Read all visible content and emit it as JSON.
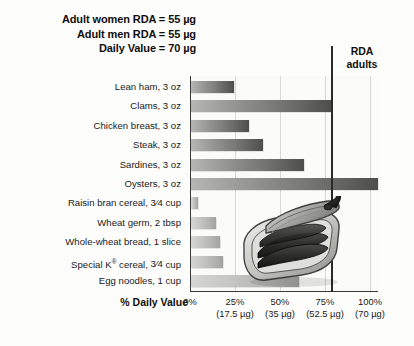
{
  "header": {
    "lines": [
      "Adult women RDA = 55 µg",
      "Adult men RDA = 55 µg",
      "Daily Value = 70 µg"
    ]
  },
  "rda_marker": {
    "line1": "RDA",
    "line2": "adults",
    "value_percent": 78.6,
    "color": "#2a2a28"
  },
  "axis_title": "% Daily Value",
  "illustration": {
    "name": "open-sardine-can",
    "description": "opened tin of sardines with rolled-back lid and key"
  },
  "chart_data": {
    "type": "bar",
    "orientation": "horizontal",
    "title": "",
    "xlabel": "% Daily Value",
    "ylabel": "",
    "xlim": [
      0,
      104
    ],
    "grid": true,
    "legend": "none",
    "categories": [
      "Lean ham, 3 oz",
      "Clams, 3 oz",
      "Chicken breast, 3 oz",
      "Steak, 3 oz",
      "Sardines, 3 oz",
      "Oysters, 3 oz",
      "Raisin bran cereal, 3/4 cup",
      "Wheat germ, 2 tbsp",
      "Whole-wheat bread, 1 slice",
      "Special K® cereal, 3/4 cup",
      "Egg noodles, 1 cup"
    ],
    "values": [
      24,
      78,
      32,
      40,
      63,
      104,
      4,
      14,
      16,
      18,
      60
    ],
    "shades": [
      "dark",
      "dark",
      "dark",
      "dark",
      "dark",
      "dark",
      "light",
      "light",
      "light",
      "light",
      "light"
    ],
    "ticks": [
      {
        "percent": "0%",
        "ug": ""
      },
      {
        "percent": "25%",
        "ug": "(17.5 µg)"
      },
      {
        "percent": "50%",
        "ug": "(35 µg)"
      },
      {
        "percent": "75%",
        "ug": "(52.5 µg)"
      },
      {
        "percent": "100%",
        "ug": "(70 µg)"
      }
    ],
    "tick_positions": [
      0,
      25,
      50,
      75,
      100
    ],
    "reference_line": {
      "label": "RDA adults",
      "value": 78.6
    }
  },
  "labels_rich": [
    {
      "pre": "Lean ham, 3 oz",
      "num": "",
      "den": "",
      "post": "",
      "reg": false
    },
    {
      "pre": "Clams, 3 oz",
      "num": "",
      "den": "",
      "post": "",
      "reg": false
    },
    {
      "pre": "Chicken breast, 3 oz",
      "num": "",
      "den": "",
      "post": "",
      "reg": false
    },
    {
      "pre": "Steak, 3 oz",
      "num": "",
      "den": "",
      "post": "",
      "reg": false
    },
    {
      "pre": "Sardines, 3 oz",
      "num": "",
      "den": "",
      "post": "",
      "reg": false
    },
    {
      "pre": "Oysters, 3 oz",
      "num": "",
      "den": "",
      "post": "",
      "reg": false
    },
    {
      "pre": "Raisin bran cereal, ",
      "num": "3",
      "den": "4",
      "post": " cup",
      "reg": false
    },
    {
      "pre": "Wheat germ, 2 tbsp",
      "num": "",
      "den": "",
      "post": "",
      "reg": false
    },
    {
      "pre": "Whole-wheat bread, 1 slice",
      "num": "",
      "den": "",
      "post": "",
      "reg": false
    },
    {
      "pre": "Special K",
      "num": "3",
      "den": "4",
      "post": " cereal, ",
      "reg": true,
      "tail": " cup"
    },
    {
      "pre": "Egg noodles, 1 cup",
      "num": "",
      "den": "",
      "post": "",
      "reg": false
    }
  ]
}
